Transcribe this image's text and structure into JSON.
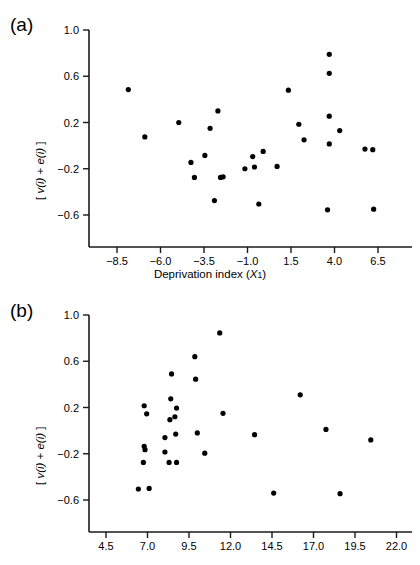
{
  "figure": {
    "panels": [
      {
        "id": "a",
        "label": "(a)",
        "xlabel_main": "Deprivation index (",
        "xlabel_var": "X",
        "xlabel_sub": "1",
        "xlabel_close": ")",
        "ylabel_open": "[ ",
        "ylabel_v": "v",
        "ylabel_i1": "(i)",
        "ylabel_plus": " + ",
        "ylabel_e": "e",
        "ylabel_i2": "(i)",
        "ylabel_close": " ]"
      },
      {
        "id": "b",
        "label": "(b)",
        "xlabel_main": "",
        "ylabel_open": "[ ",
        "ylabel_v": "v",
        "ylabel_i1": "(i)",
        "ylabel_plus": " + ",
        "ylabel_e": "e",
        "ylabel_i2": "(i)",
        "ylabel_close": " ]"
      }
    ]
  },
  "chart_data": [
    {
      "type": "scatter",
      "panel": "a",
      "title": "",
      "xlabel": "Deprivation index (X1)",
      "ylabel": "[ v(i) + e(i) ]",
      "xlim": [
        -9.75,
        7.75
      ],
      "ylim": [
        -0.8,
        1.0
      ],
      "xticks": [
        -8.5,
        -6.0,
        -3.5,
        -1.0,
        1.5,
        4.0,
        6.5
      ],
      "xticklabels": [
        "−8.5",
        "−6.0",
        "−3.5",
        "−1.0",
        "1.5",
        "4.0",
        "6.5"
      ],
      "yticks": [
        1.0,
        0.6,
        0.2,
        -0.2,
        -0.6
      ],
      "yticklabels": [
        "1.0",
        "0.6",
        "0.2",
        "−0.2",
        "−0.6"
      ],
      "grid": false,
      "legend": false,
      "marker": "circle",
      "marker_color": "#000000",
      "points": [
        {
          "x": -7.85,
          "y": 0.485
        },
        {
          "x": -6.9,
          "y": 0.075
        },
        {
          "x": -4.95,
          "y": 0.2
        },
        {
          "x": -4.25,
          "y": -0.145
        },
        {
          "x": -4.05,
          "y": -0.275
        },
        {
          "x": -3.15,
          "y": 0.15
        },
        {
          "x": -3.45,
          "y": -0.085
        },
        {
          "x": -2.7,
          "y": 0.3
        },
        {
          "x": -2.55,
          "y": -0.275
        },
        {
          "x": -2.4,
          "y": -0.27
        },
        {
          "x": -2.9,
          "y": -0.475
        },
        {
          "x": -1.15,
          "y": -0.2
        },
        {
          "x": -0.7,
          "y": -0.095
        },
        {
          "x": -0.6,
          "y": -0.185
        },
        {
          "x": -0.1,
          "y": -0.05
        },
        {
          "x": -0.35,
          "y": -0.505
        },
        {
          "x": 0.7,
          "y": -0.18
        },
        {
          "x": 1.35,
          "y": 0.48
        },
        {
          "x": 1.95,
          "y": 0.185
        },
        {
          "x": 2.25,
          "y": 0.05
        },
        {
          "x": 3.7,
          "y": 0.79
        },
        {
          "x": 3.7,
          "y": 0.625
        },
        {
          "x": 3.7,
          "y": 0.255
        },
        {
          "x": 3.7,
          "y": 0.015
        },
        {
          "x": 4.3,
          "y": 0.13
        },
        {
          "x": 3.6,
          "y": -0.555
        },
        {
          "x": 5.75,
          "y": -0.03
        },
        {
          "x": 6.2,
          "y": -0.035
        },
        {
          "x": 6.25,
          "y": -0.55
        }
      ]
    },
    {
      "type": "scatter",
      "panel": "b",
      "title": "",
      "xlabel": "",
      "ylabel": "[ v(i) + e(i) ]",
      "xlim": [
        3.1,
        23.4
      ],
      "ylim": [
        -0.8,
        1.0
      ],
      "xticks": [
        4.5,
        7.0,
        9.5,
        12.0,
        14.5,
        17.0,
        19.5,
        22.0
      ],
      "xticklabels": [
        "4.5",
        "7.0",
        "9.5",
        "12.0",
        "14.5",
        "17.0",
        "19.5",
        "22.0"
      ],
      "yticks": [
        1.0,
        0.6,
        0.2,
        -0.2,
        -0.6
      ],
      "yticklabels": [
        "1.0",
        "0.6",
        "0.2",
        "−0.2",
        "−0.6"
      ],
      "grid": false,
      "legend": false,
      "marker": "circle",
      "marker_color": "#000000",
      "points": [
        {
          "x": 6.8,
          "y": 0.215
        },
        {
          "x": 6.95,
          "y": 0.145
        },
        {
          "x": 6.8,
          "y": -0.135
        },
        {
          "x": 6.85,
          "y": -0.165
        },
        {
          "x": 6.75,
          "y": -0.275
        },
        {
          "x": 6.45,
          "y": -0.505
        },
        {
          "x": 7.1,
          "y": -0.5
        },
        {
          "x": 8.05,
          "y": -0.06
        },
        {
          "x": 8.05,
          "y": -0.185
        },
        {
          "x": 8.4,
          "y": 0.275
        },
        {
          "x": 8.35,
          "y": 0.095
        },
        {
          "x": 8.3,
          "y": -0.275
        },
        {
          "x": 8.45,
          "y": 0.49
        },
        {
          "x": 8.65,
          "y": 0.12
        },
        {
          "x": 8.7,
          "y": -0.03
        },
        {
          "x": 8.75,
          "y": 0.195
        },
        {
          "x": 8.75,
          "y": -0.275
        },
        {
          "x": 9.85,
          "y": 0.64
        },
        {
          "x": 9.9,
          "y": 0.445
        },
        {
          "x": 10.0,
          "y": -0.02
        },
        {
          "x": 10.45,
          "y": -0.195
        },
        {
          "x": 11.35,
          "y": 0.845
        },
        {
          "x": 11.55,
          "y": 0.15
        },
        {
          "x": 13.45,
          "y": -0.035
        },
        {
          "x": 14.6,
          "y": -0.54
        },
        {
          "x": 16.2,
          "y": 0.31
        },
        {
          "x": 17.75,
          "y": 0.01
        },
        {
          "x": 18.6,
          "y": -0.545
        },
        {
          "x": 20.45,
          "y": -0.08
        }
      ]
    }
  ]
}
